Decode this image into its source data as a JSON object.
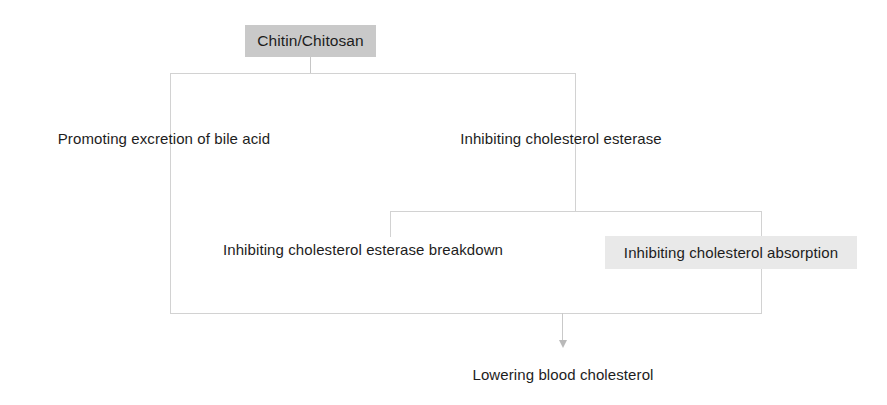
{
  "diagram": {
    "type": "flowchart",
    "colors": {
      "line": "#d2d2d2",
      "node_shaded_dark": "#c9c9c9",
      "node_shaded_light": "#e9e9e9",
      "text": "#1d1d1d",
      "background": "#ffffff",
      "arrow": "#b9b9b9"
    },
    "nodes": [
      {
        "id": "chitin",
        "label": "Chitin/Chitosan",
        "style": "shaded-dark",
        "level": 0
      },
      {
        "id": "bile-acid",
        "label": "Promoting excretion of bile acid",
        "style": "plain",
        "level": 1
      },
      {
        "id": "chol-esterase",
        "label": "Inhibiting cholesterol esterase",
        "style": "plain",
        "level": 1
      },
      {
        "id": "breakdown",
        "label": "Inhibiting cholesterol esterase breakdown",
        "style": "plain",
        "level": 2
      },
      {
        "id": "absorption",
        "label": "Inhibiting cholesterol absorption",
        "style": "shaded-light",
        "level": 2
      },
      {
        "id": "lowering",
        "label": "Lowering blood cholesterol",
        "style": "plain",
        "level": 3
      }
    ],
    "edges": [
      {
        "from": "chitin",
        "to": "bile-acid"
      },
      {
        "from": "chitin",
        "to": "chol-esterase"
      },
      {
        "from": "chol-esterase",
        "to": "breakdown"
      },
      {
        "from": "chol-esterase",
        "to": "absorption"
      },
      {
        "from": "bile-acid",
        "to": "lowering"
      },
      {
        "from": "breakdown",
        "to": "lowering"
      },
      {
        "from": "absorption",
        "to": "lowering"
      }
    ]
  }
}
